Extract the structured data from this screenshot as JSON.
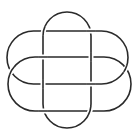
{
  "figure": {
    "type": "knot-diagram",
    "width": 140,
    "height": 140,
    "background": "#ffffff",
    "stroke_color": "#2a2a2a",
    "stroke_width": 1.6,
    "gap_color": "#ffffff",
    "gap_width": 5,
    "components": [
      {
        "name": "vertical-loop",
        "shape": "stadium",
        "x": 43,
        "y": 12,
        "w": 48,
        "h": 116
      },
      {
        "name": "upper-horizontal-loop",
        "shape": "stadium",
        "x": 7,
        "y": 31,
        "w": 121,
        "h": 53
      },
      {
        "name": "lower-horizontal-loop",
        "shape": "stadium",
        "x": 8,
        "y": 57,
        "w": 123,
        "h": 54
      }
    ],
    "crossings": [
      {
        "at": [
          43,
          31
        ],
        "over": "vertical-loop"
      },
      {
        "at": [
          43,
          57
        ],
        "over": "lower-horizontal-loop"
      },
      {
        "at": [
          43,
          84
        ],
        "over": "vertical-loop"
      },
      {
        "at": [
          43,
          111
        ],
        "over": "lower-horizontal-loop"
      },
      {
        "at": [
          91,
          31
        ],
        "over": "upper-horizontal-loop"
      },
      {
        "at": [
          91,
          57
        ],
        "over": "vertical-loop"
      },
      {
        "at": [
          91,
          84
        ],
        "over": "upper-horizontal-loop"
      },
      {
        "at": [
          91,
          111
        ],
        "over": "vertical-loop"
      },
      {
        "at": [
          10,
          70
        ],
        "over": "lower-horizontal-loop"
      },
      {
        "at": [
          128,
          70
        ],
        "over": "upper-horizontal-loop"
      }
    ]
  }
}
